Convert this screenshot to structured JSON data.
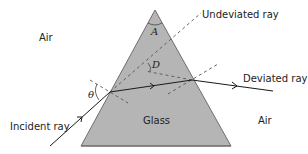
{
  "diagram": {
    "labels": {
      "air_left": "Air",
      "air_right": "Air",
      "glass": "Glass",
      "incident_ray": "Incident ray",
      "undeviated_ray": "Undeviated ray",
      "deviated_ray": "Deviated ray",
      "apex_angle": "A",
      "deviation_angle": "D",
      "incidence_angle": "θ"
    },
    "colors": {
      "prism_fill": "#b5b5b5",
      "prism_edge": "#6e6e6e",
      "ray": "#1a1a1a",
      "dashed": "#555555",
      "text": "#222222"
    }
  }
}
